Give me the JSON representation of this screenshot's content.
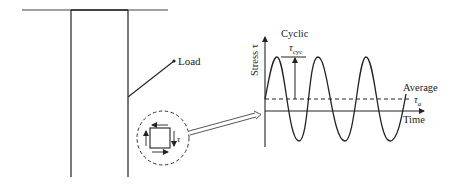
{
  "diagram": {
    "left_panel": {
      "load_label": "Load",
      "element_shear_label": "τ"
    },
    "graph": {
      "title": "Cyclic",
      "y_axis_label": "Stress τ",
      "x_axis_label": "Time",
      "amplitude_label_main": "τ",
      "amplitude_label_sub": "cyc",
      "average_label": "Average",
      "average_symbol_main": "τ",
      "average_symbol_sub": "a"
    },
    "colors": {
      "line": "#222222",
      "background": "#ffffff"
    }
  }
}
